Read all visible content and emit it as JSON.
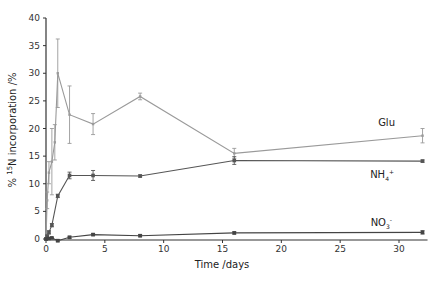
{
  "chart_data": {
    "type": "line",
    "title": "",
    "xlabel": "Time /days",
    "ylabel": "% 15N incorporation /%",
    "ylabel_parts": {
      "prefix": "% ",
      "sup": "15",
      "suffix": "N incorporation /%"
    },
    "xlim": [
      0,
      32
    ],
    "ylim": [
      0,
      40
    ],
    "xticks": [
      0,
      5,
      10,
      15,
      20,
      25,
      30
    ],
    "yticks": [
      0,
      5,
      10,
      15,
      20,
      25,
      30,
      35,
      40
    ],
    "grid": false,
    "legend": "inline labels at right",
    "series": [
      {
        "name": "Glu",
        "label": "Glu",
        "color": "#9a9a9a",
        "x": [
          0,
          0.1,
          0.25,
          0.5,
          0.75,
          1,
          2,
          4,
          8,
          16,
          32
        ],
        "y": [
          0,
          7,
          12,
          14,
          17.5,
          30,
          22.5,
          20.8,
          25.8,
          15.5,
          18.7
        ],
        "err": [
          0,
          1.5,
          2,
          6,
          3.2,
          6.2,
          5.2,
          1.9,
          0.6,
          0.9,
          1.3
        ],
        "label_pos": {
          "x": 395,
          "y": 126
        }
      },
      {
        "name": "NH4+",
        "label": "NH",
        "label_sub": "4",
        "label_sup": "+",
        "color": "#555555",
        "x": [
          0,
          0.1,
          0.25,
          0.5,
          1,
          2,
          4,
          8,
          16,
          32
        ],
        "y": [
          0,
          0.5,
          1.2,
          2.5,
          7.8,
          11.5,
          11.5,
          11.4,
          14.2,
          14.1
        ],
        "err": [
          0,
          0.2,
          0.3,
          0.3,
          0.3,
          0.6,
          0.9,
          0.2,
          0.7,
          0.2
        ],
        "label_pos": {
          "x": 394,
          "y": 178
        }
      },
      {
        "name": "NO3-",
        "label": "NO",
        "label_sub": "3",
        "label_sup": "-",
        "color": "#444444",
        "x": [
          0,
          0.25,
          0.5,
          1,
          2,
          4,
          8,
          16,
          32
        ],
        "y": [
          0,
          0.1,
          0.2,
          -0.3,
          0.3,
          0.8,
          0.6,
          1.1,
          1.2
        ],
        "err": [
          0,
          0.1,
          0.1,
          0.2,
          0.2,
          0.2,
          0.2,
          0.2,
          0.3
        ],
        "label_pos": {
          "x": 392,
          "y": 226
        }
      }
    ]
  }
}
